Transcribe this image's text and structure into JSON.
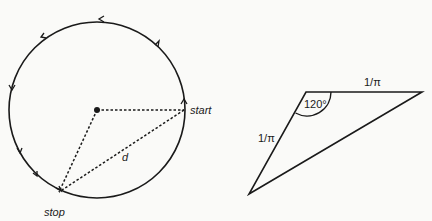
{
  "circle_figure": {
    "center_dot": "center",
    "labels": {
      "start": "start",
      "stop": "stop",
      "distance": "d"
    },
    "direction": "counterclockwise",
    "arrow_count": 8
  },
  "triangle_figure": {
    "angle_label": "120°",
    "side_top_label": "1/π",
    "side_left_label": "1/π"
  },
  "colors": {
    "stroke": "#1a1a1a",
    "background": "#fafaf8"
  }
}
